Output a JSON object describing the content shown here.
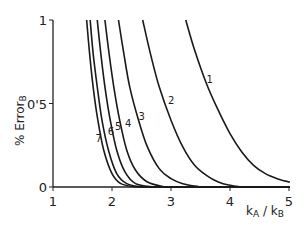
{
  "chart_data": {
    "type": "line",
    "title": "",
    "xlabel": "kA / kB",
    "ylabel": "% Error B",
    "xlim": [
      1,
      5
    ],
    "ylim": [
      0,
      1
    ],
    "xticks": [
      "1",
      "2",
      "3",
      "4",
      "5"
    ],
    "yticks": [
      "0",
      "0.5",
      "1"
    ],
    "ytick_labels_shown": [
      "0",
      "0'5",
      "1"
    ],
    "grid": false,
    "legend": "inline curve labels 1-7",
    "series": [
      {
        "name": "1",
        "points": [
          [
            3.25,
            1.0
          ],
          [
            3.4,
            0.82
          ],
          [
            3.6,
            0.62
          ],
          [
            3.8,
            0.46
          ],
          [
            4.0,
            0.32
          ],
          [
            4.2,
            0.21
          ],
          [
            4.4,
            0.13
          ],
          [
            4.6,
            0.08
          ],
          [
            4.8,
            0.05
          ],
          [
            5.0,
            0.03
          ]
        ]
      },
      {
        "name": "2",
        "points": [
          [
            2.52,
            1.0
          ],
          [
            2.65,
            0.8
          ],
          [
            2.8,
            0.6
          ],
          [
            3.0,
            0.4
          ],
          [
            3.2,
            0.24
          ],
          [
            3.4,
            0.13
          ],
          [
            3.6,
            0.07
          ],
          [
            3.8,
            0.03
          ],
          [
            4.0,
            0.01
          ],
          [
            4.2,
            0.0
          ]
        ]
      },
      {
        "name": "3",
        "points": [
          [
            2.11,
            1.0
          ],
          [
            2.2,
            0.8
          ],
          [
            2.3,
            0.6
          ],
          [
            2.45,
            0.4
          ],
          [
            2.6,
            0.24
          ],
          [
            2.8,
            0.11
          ],
          [
            3.0,
            0.05
          ],
          [
            3.2,
            0.02
          ],
          [
            3.5,
            0.0
          ]
        ]
      },
      {
        "name": "4",
        "points": [
          [
            1.88,
            1.0
          ],
          [
            1.95,
            0.8
          ],
          [
            2.03,
            0.6
          ],
          [
            2.13,
            0.4
          ],
          [
            2.25,
            0.22
          ],
          [
            2.4,
            0.1
          ],
          [
            2.6,
            0.03
          ],
          [
            2.9,
            0.0
          ]
        ]
      },
      {
        "name": "5",
        "points": [
          [
            1.75,
            1.0
          ],
          [
            1.81,
            0.8
          ],
          [
            1.88,
            0.6
          ],
          [
            1.97,
            0.4
          ],
          [
            2.08,
            0.22
          ],
          [
            2.22,
            0.09
          ],
          [
            2.4,
            0.02
          ],
          [
            2.7,
            0.0
          ]
        ]
      },
      {
        "name": "6",
        "points": [
          [
            1.63,
            1.0
          ],
          [
            1.68,
            0.8
          ],
          [
            1.75,
            0.6
          ],
          [
            1.83,
            0.4
          ],
          [
            1.94,
            0.22
          ],
          [
            2.08,
            0.08
          ],
          [
            2.25,
            0.02
          ],
          [
            2.5,
            0.0
          ]
        ]
      },
      {
        "name": "7",
        "points": [
          [
            1.57,
            1.0
          ],
          [
            1.62,
            0.8
          ],
          [
            1.68,
            0.6
          ],
          [
            1.76,
            0.4
          ],
          [
            1.86,
            0.22
          ],
          [
            2.0,
            0.08
          ],
          [
            2.15,
            0.02
          ],
          [
            2.4,
            0.0
          ]
        ]
      }
    ],
    "curve_labels": [
      {
        "text": "1",
        "x": 3.6,
        "y": 0.62
      },
      {
        "text": "2",
        "x": 2.95,
        "y": 0.5
      },
      {
        "text": "3",
        "x": 2.45,
        "y": 0.4
      },
      {
        "text": "4",
        "x": 2.22,
        "y": 0.36
      },
      {
        "text": "5",
        "x": 2.05,
        "y": 0.34
      },
      {
        "text": "6",
        "x": 1.93,
        "y": 0.31
      },
      {
        "text": "7",
        "x": 1.72,
        "y": 0.27
      }
    ]
  },
  "axes": {
    "xlabel_main": "k",
    "xlabel_sub_a": "A",
    "xlabel_sep": " / k",
    "xlabel_sub_b": "B",
    "ylabel_main": "% Error",
    "ylabel_sub": "B"
  }
}
